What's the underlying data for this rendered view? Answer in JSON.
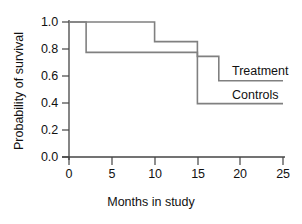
{
  "chart_data": {
    "type": "line",
    "title": "",
    "xlabel": "Months in study",
    "ylabel": "Probability of survival",
    "xlim": [
      0,
      25
    ],
    "ylim": [
      0.0,
      1.0
    ],
    "xticks": [
      "0",
      "5",
      "10",
      "15",
      "20",
      "25"
    ],
    "yticks": [
      "1.0",
      "0.8",
      "0.6",
      "0.4",
      "0.2",
      "0.0"
    ],
    "xtick_values": [
      0,
      5,
      10,
      15,
      20,
      25
    ],
    "ytick_values": [
      1.0,
      0.8,
      0.6,
      0.4,
      0.2,
      0.0
    ],
    "grid": false,
    "legend_position": "inline-right",
    "line_color": "#808080",
    "axis_color": "#333333",
    "step_style": "post",
    "series": [
      {
        "name": "Treatment",
        "label_x": 20.5,
        "label_y": 0.64,
        "steps": [
          {
            "x_start": 0,
            "x_end": 10,
            "y": 1.0
          },
          {
            "x_start": 10,
            "x_end": 15,
            "y": 0.855
          },
          {
            "x_start": 15,
            "x_end": 17.5,
            "y": 0.745
          },
          {
            "x_start": 17.5,
            "x_end": 25,
            "y": 0.565
          }
        ],
        "x": [
          0,
          10,
          10,
          15,
          15,
          17.5,
          17.5,
          25
        ],
        "y": [
          1.0,
          1.0,
          0.855,
          0.855,
          0.745,
          0.745,
          0.565,
          0.565
        ]
      },
      {
        "name": "Controls",
        "label_x": 20.5,
        "label_y": 0.465,
        "steps": [
          {
            "x_start": 0,
            "x_end": 2,
            "y": 1.0
          },
          {
            "x_start": 2,
            "x_end": 15,
            "y": 0.775
          },
          {
            "x_start": 15,
            "x_end": 25,
            "y": 0.395
          }
        ],
        "x": [
          0,
          2,
          2,
          15,
          15,
          25
        ],
        "y": [
          1.0,
          1.0,
          0.775,
          0.775,
          0.395,
          0.395
        ]
      }
    ]
  }
}
